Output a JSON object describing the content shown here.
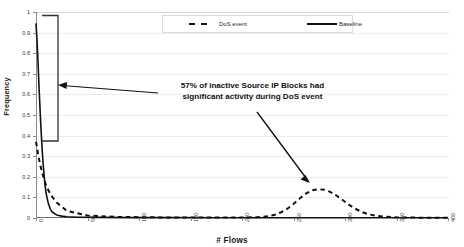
{
  "figure": {
    "title_fragment": "",
    "background": "#ffffff"
  },
  "chart_data": {
    "type": "line",
    "title": "",
    "xlabel": "# Flows",
    "ylabel": "Frequency",
    "xlim": [
      0,
      400
    ],
    "ylim": [
      0,
      1
    ],
    "xticks": [
      0,
      50,
      100,
      150,
      200,
      250,
      300,
      350,
      400
    ],
    "xtick_labels": [
      "0",
      "50",
      "100",
      "150",
      "200",
      "250",
      "300",
      "350",
      "400"
    ],
    "yticks": [
      0,
      0.1,
      0.2,
      0.3,
      0.4,
      0.5,
      0.6,
      0.7,
      0.8,
      0.9,
      1
    ],
    "ytick_labels": [
      "0",
      "0.1",
      "0.2",
      "0.3",
      "0.4",
      "0.5",
      "0.6",
      "0.7",
      "0.8",
      "0.9",
      "1"
    ],
    "grid": "horizontal",
    "legend_position": "top-center",
    "series": [
      {
        "name": "DoS event",
        "style": "dashed",
        "color": "#111111",
        "x": [
          0,
          2,
          4,
          6,
          8,
          10,
          14,
          20,
          30,
          50,
          80,
          120,
          160,
          200,
          215,
          225,
          232,
          238,
          244,
          250,
          256,
          262,
          268,
          274,
          280,
          286,
          292,
          298,
          304,
          310,
          316,
          322,
          330,
          340,
          352,
          366,
          380,
          400
        ],
        "y": [
          0.37,
          0.31,
          0.26,
          0.22,
          0.185,
          0.155,
          0.115,
          0.075,
          0.035,
          0.012,
          0.005,
          0.003,
          0.002,
          0.002,
          0.004,
          0.008,
          0.016,
          0.028,
          0.045,
          0.068,
          0.095,
          0.118,
          0.134,
          0.14,
          0.137,
          0.126,
          0.108,
          0.086,
          0.064,
          0.045,
          0.03,
          0.019,
          0.011,
          0.006,
          0.003,
          0.002,
          0.001,
          0.001
        ]
      },
      {
        "name": "Baseline",
        "style": "solid",
        "color": "#111111",
        "x": [
          0,
          1,
          2,
          3,
          4,
          5,
          6,
          7,
          8,
          9,
          10,
          12,
          14,
          16,
          20,
          25,
          30,
          40,
          60,
          90,
          130,
          180,
          240,
          300,
          360,
          400
        ],
        "y": [
          0.945,
          0.86,
          0.75,
          0.63,
          0.52,
          0.42,
          0.33,
          0.26,
          0.2,
          0.15,
          0.115,
          0.07,
          0.042,
          0.028,
          0.015,
          0.009,
          0.006,
          0.004,
          0.003,
          0.002,
          0.002,
          0.001,
          0.001,
          0.001,
          0.001,
          0.001
        ]
      }
    ],
    "annotations": [
      {
        "name": "callout-text",
        "text_line_1": "57% of inactive Source IP Blocks had",
        "text_line_2": "significant activity during DoS event"
      },
      {
        "name": "bracket",
        "description": "vertical bracket spanning the baseline drop",
        "y_top": 0.945,
        "y_bottom": 0.39,
        "x": 20
      }
    ]
  },
  "legend": {
    "items": [
      {
        "label": "DoS event",
        "style": "dashed"
      },
      {
        "label": "Baseline",
        "style": "solid"
      }
    ]
  },
  "axis": {
    "x_title": "# Flows",
    "y_title": "Frequency"
  }
}
